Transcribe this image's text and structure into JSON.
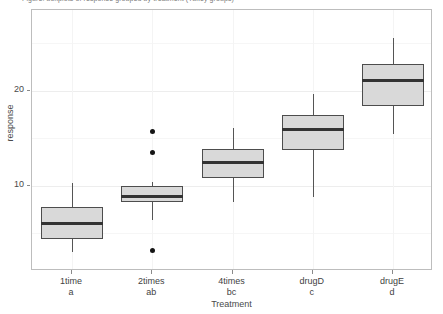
{
  "caption": "Figure: boxplots of response grouped by treatment (Tukey groups)",
  "axis": {
    "y_title": "response",
    "x_title": "Treatment",
    "y_ticks": [
      {
        "label": "10",
        "value": 10
      },
      {
        "label": "20",
        "value": 20
      }
    ],
    "y_minor_values": [
      5,
      15,
      25
    ],
    "y_range": [
      1.0,
      28.5
    ]
  },
  "chart_data": {
    "type": "box",
    "title": "",
    "xlabel": "Treatment",
    "ylabel": "response",
    "ylim": [
      1.0,
      28.5
    ],
    "grid": true,
    "legend": "none",
    "categories": [
      "1time",
      "2times",
      "4times",
      "drugD",
      "drugE"
    ],
    "group_letters": [
      "a",
      "ab",
      "bc",
      "c",
      "d"
    ],
    "boxes": [
      {
        "category": "1time",
        "letter": "a",
        "whisker_low": 3.0,
        "q1": 4.4,
        "median": 6.0,
        "q3": 7.7,
        "whisker_high": 10.3,
        "outliers": []
      },
      {
        "category": "2times",
        "letter": "ab",
        "whisker_low": 6.4,
        "q1": 8.3,
        "median": 8.8,
        "q3": 10.0,
        "whisker_high": 10.4,
        "outliers": [
          15.7,
          13.5,
          3.2
        ]
      },
      {
        "category": "4times",
        "letter": "bc",
        "whisker_low": 8.3,
        "q1": 10.8,
        "median": 12.4,
        "q3": 13.9,
        "whisker_high": 16.1,
        "outliers": []
      },
      {
        "category": "drugD",
        "letter": "c",
        "whisker_low": 8.8,
        "q1": 13.7,
        "median": 15.9,
        "q3": 17.4,
        "whisker_high": 19.7,
        "outliers": []
      },
      {
        "category": "drugE",
        "letter": "d",
        "whisker_low": 15.4,
        "q1": 18.4,
        "median": 21.1,
        "q3": 22.8,
        "whisker_high": 25.6,
        "outliers": []
      }
    ]
  },
  "style": {
    "box_fill": "#d9d9d9",
    "box_border": "#4d4d4d",
    "median_color": "#333333",
    "outlier_color": "#151515",
    "panel_border": "#bdbdbd",
    "grid_major": "#ededed"
  }
}
